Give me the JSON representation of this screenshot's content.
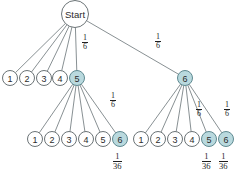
{
  "figure": {
    "name": "probability-tree-diagram",
    "type": "tree",
    "colors": {
      "highlight_fill": "#b9d9de",
      "highlight_stroke": "#5f8a91",
      "node_fill": "#ffffff",
      "node_stroke": "#6b7376",
      "edge_stroke": "#7b8387",
      "text": "#1f1f1f",
      "background": "#ffffff"
    },
    "root": {
      "label": "Start",
      "cx": 75,
      "cy": 14,
      "r": 13.5
    },
    "level1": {
      "cy": 78,
      "r": 7.5,
      "nodes": [
        {
          "label": "1",
          "cx": 10,
          "highlight": false
        },
        {
          "label": "2",
          "cx": 27,
          "highlight": false
        },
        {
          "label": "3",
          "cx": 44,
          "highlight": false
        },
        {
          "label": "4",
          "cx": 60,
          "highlight": false
        },
        {
          "label": "5",
          "cx": 77,
          "highlight": true
        },
        {
          "label": "6",
          "cx": 185,
          "highlight": true
        }
      ]
    },
    "level2_left": {
      "cy": 139,
      "r": 7.5,
      "parent_cx": 77,
      "nodes": [
        {
          "label": "1",
          "cx": 35,
          "highlight": false
        },
        {
          "label": "2",
          "cx": 52,
          "highlight": false
        },
        {
          "label": "3",
          "cx": 69,
          "highlight": false
        },
        {
          "label": "4",
          "cx": 86,
          "highlight": false
        },
        {
          "label": "5",
          "cx": 103,
          "highlight": false
        },
        {
          "label": "6",
          "cx": 120,
          "highlight": true
        }
      ]
    },
    "level2_right": {
      "cy": 139,
      "r": 7.5,
      "parent_cx": 185,
      "nodes": [
        {
          "label": "1",
          "cx": 141,
          "highlight": false
        },
        {
          "label": "2",
          "cx": 158,
          "highlight": false
        },
        {
          "label": "3",
          "cx": 175,
          "highlight": false
        },
        {
          "label": "4",
          "cx": 192,
          "highlight": false
        },
        {
          "label": "5",
          "cx": 209,
          "highlight": true
        },
        {
          "label": "6",
          "cx": 226,
          "highlight": true
        }
      ]
    },
    "edge_labels": [
      {
        "id": "root-to-5",
        "numerator": "1",
        "denominator": "6",
        "x": 82,
        "y": 34
      },
      {
        "id": "root-to-6",
        "numerator": "1",
        "denominator": "6",
        "x": 155,
        "y": 33
      },
      {
        "id": "five-to-six",
        "numerator": "1",
        "denominator": "6",
        "x": 110,
        "y": 92
      },
      {
        "id": "six-to-five",
        "numerator": "1",
        "denominator": "6",
        "x": 196,
        "y": 101
      },
      {
        "id": "six-to-six",
        "numerator": "1",
        "denominator": "6",
        "x": 224,
        "y": 101
      }
    ],
    "outcome_labels": [
      {
        "id": "prob-5-6",
        "numerator": "1",
        "denominator": "36",
        "x": 113,
        "y": 152
      },
      {
        "id": "prob-6-5",
        "numerator": "1",
        "denominator": "36",
        "x": 202,
        "y": 152
      },
      {
        "id": "prob-6-6",
        "numerator": "1",
        "denominator": "36",
        "x": 219,
        "y": 152
      }
    ]
  }
}
